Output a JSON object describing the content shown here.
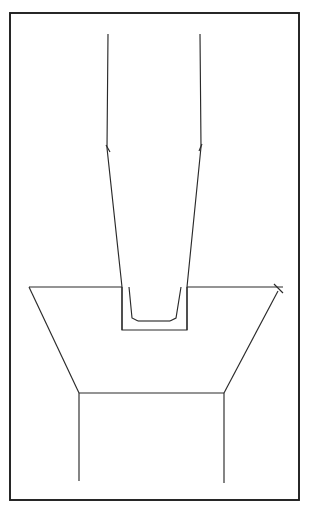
{
  "figure": {
    "canvas": {
      "width": 311,
      "height": 517,
      "background": "#ffffff"
    },
    "stroke_color": "#2a2a2a",
    "frame_color": "#1d1d1d",
    "frame": {
      "name": "outer-border-frame",
      "x": 10,
      "y": 13,
      "width": 289,
      "height": 487,
      "stroke_width": 1.9
    },
    "shapes": {
      "funnel_left_wall": {
        "name": "funnel-left-wall",
        "points": "108,34 107,148 122,287 122,330"
      },
      "funnel_right_wall": {
        "name": "funnel-right-wall",
        "points": "200,34 201,147 187,287 187,330"
      },
      "inner_taper_left": {
        "name": "inner-taper-left-wall",
        "points": "129,287 132,318 138,321"
      },
      "inner_taper_right": {
        "name": "inner-taper-right-wall",
        "points": "181,287 176,318 170,321"
      },
      "inner_trough_bottom": {
        "name": "inner-trough-bottom",
        "points": "138,321 170,321"
      },
      "outer_trough_box": {
        "name": "outer-trough-box",
        "points": "122,287 122,330 187,330 187,287"
      },
      "hopper_top_edge_left": {
        "name": "hopper-top-edge-left",
        "points": "29,287 122,287"
      },
      "hopper_top_edge_right": {
        "name": "hopper-top-edge-right",
        "points": "187,287 283,287"
      },
      "hopper_left_slope": {
        "name": "hopper-left-slope",
        "points": "29,287 79,393"
      },
      "hopper_right_slope": {
        "name": "hopper-right-slope",
        "points": "278,291 224,393"
      },
      "hopper_bottom_edge": {
        "name": "hopper-bottom-edge",
        "points": "79,393 224,393"
      },
      "leg_left": {
        "name": "hopper-left-leg",
        "points": "79,393 79,481"
      },
      "leg_right": {
        "name": "hopper-right-leg",
        "points": "224,393 224,483"
      },
      "cross_mark": {
        "name": "x-cross-mark",
        "points": "274,284 283,293"
      },
      "arrow_tick_left": {
        "name": "left-wall-arrow-tick",
        "points": "106,145 110,152"
      },
      "arrow_tick_right": {
        "name": "right-wall-arrow-tick",
        "points": "202,144 199,151"
      }
    }
  }
}
